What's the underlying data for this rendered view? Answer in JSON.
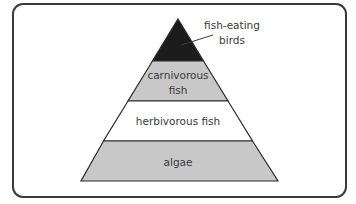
{
  "diagram": {
    "type": "food-pyramid",
    "colors": {
      "dark": "#1c1c1c",
      "gray": "#c8c8c8",
      "white": "#ffffff",
      "stroke": "#2a2a2a",
      "text": "#3a3a3a"
    },
    "levels": [
      {
        "label_lines": [
          "fish-eating",
          "birds"
        ],
        "fill": "dark",
        "callout": true
      },
      {
        "label_lines": [
          "carnivorous",
          "fish"
        ],
        "fill": "gray"
      },
      {
        "label_lines": [
          "herbivorous fish"
        ],
        "fill": "white"
      },
      {
        "label_lines": [
          "algae"
        ],
        "fill": "gray"
      }
    ]
  }
}
